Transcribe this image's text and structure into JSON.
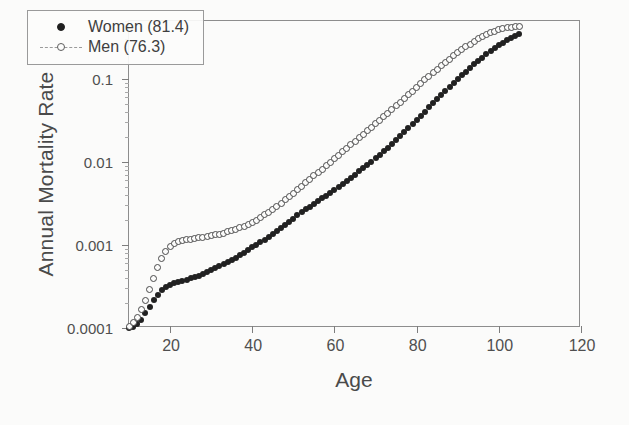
{
  "chart_data": {
    "type": "scatter",
    "title": "",
    "xlabel": "Age",
    "ylabel": "Annual Mortality Rate",
    "xlim": [
      10,
      120
    ],
    "ylim": [
      0.0001,
      0.5
    ],
    "yscale": "log",
    "grid": false,
    "legend_position": "upper-left-inside",
    "xticks": [
      20,
      40,
      60,
      80,
      100,
      120
    ],
    "xtick_labels": [
      "20",
      "40",
      "60",
      "80",
      "100",
      "120"
    ],
    "yticks": [
      0.0001,
      0.001,
      0.01,
      0.1
    ],
    "ytick_labels": [
      "0.0001",
      "0.001",
      "0.01",
      "0.1"
    ],
    "series": [
      {
        "name": "Women (81.4)",
        "marker": "filled-circle",
        "color": "#212121",
        "x": [
          10,
          11,
          12,
          13,
          14,
          15,
          16,
          17,
          18,
          19,
          20,
          21,
          22,
          23,
          24,
          25,
          26,
          27,
          28,
          29,
          30,
          31,
          32,
          33,
          34,
          35,
          36,
          37,
          38,
          39,
          40,
          41,
          42,
          43,
          44,
          45,
          46,
          47,
          48,
          49,
          50,
          51,
          52,
          53,
          54,
          55,
          56,
          57,
          58,
          59,
          60,
          61,
          62,
          63,
          64,
          65,
          66,
          67,
          68,
          69,
          70,
          71,
          72,
          73,
          74,
          75,
          76,
          77,
          78,
          79,
          80,
          81,
          82,
          83,
          84,
          85,
          86,
          87,
          88,
          89,
          90,
          91,
          92,
          93,
          94,
          95,
          96,
          97,
          98,
          99,
          100,
          101,
          102,
          103,
          104,
          105
        ],
        "y": [
          0.0001,
          0.000104,
          0.000112,
          0.000126,
          0.00015,
          0.00018,
          0.000215,
          0.00025,
          0.000285,
          0.00031,
          0.00033,
          0.000345,
          0.000358,
          0.00037,
          0.000382,
          0.000395,
          0.00041,
          0.000428,
          0.000448,
          0.00047,
          0.000495,
          0.000522,
          0.000552,
          0.000585,
          0.00062,
          0.00066,
          0.000705,
          0.000755,
          0.00081,
          0.00087,
          0.000935,
          0.001005,
          0.00108,
          0.00116,
          0.00125,
          0.00135,
          0.001465,
          0.001595,
          0.00174,
          0.0019,
          0.00208,
          0.00227,
          0.00247,
          0.00268,
          0.0029,
          0.00313,
          0.00338,
          0.00365,
          0.00394,
          0.00425,
          0.0046,
          0.00499,
          0.00543,
          0.00592,
          0.00646,
          0.00705,
          0.0077,
          0.00842,
          0.00922,
          0.0101,
          0.0111,
          0.0122,
          0.0134,
          0.0148,
          0.0164,
          0.0182,
          0.0203,
          0.0227,
          0.0254,
          0.0285,
          0.032,
          0.036,
          0.0405,
          0.0455,
          0.051,
          0.0575,
          0.0645,
          0.072,
          0.081,
          0.09,
          0.1,
          0.111,
          0.123,
          0.136,
          0.15,
          0.165,
          0.181,
          0.198,
          0.216,
          0.235,
          0.255,
          0.275,
          0.295,
          0.315,
          0.333,
          0.35
        ]
      },
      {
        "name": "Men (76.3)",
        "marker": "open-circle",
        "color": "#4a4a4a",
        "linestyle": "dashed",
        "x": [
          10,
          11,
          12,
          13,
          14,
          15,
          16,
          17,
          18,
          19,
          20,
          21,
          22,
          23,
          24,
          25,
          26,
          27,
          28,
          29,
          30,
          31,
          32,
          33,
          34,
          35,
          36,
          37,
          38,
          39,
          40,
          41,
          42,
          43,
          44,
          45,
          46,
          47,
          48,
          49,
          50,
          51,
          52,
          53,
          54,
          55,
          56,
          57,
          58,
          59,
          60,
          61,
          62,
          63,
          64,
          65,
          66,
          67,
          68,
          69,
          70,
          71,
          72,
          73,
          74,
          75,
          76,
          77,
          78,
          79,
          80,
          81,
          82,
          83,
          84,
          85,
          86,
          87,
          88,
          89,
          90,
          91,
          92,
          93,
          94,
          95,
          96,
          97,
          98,
          99,
          100,
          101,
          102,
          103,
          104,
          105
        ],
        "y": [
          0.000105,
          0.000115,
          0.000135,
          0.000165,
          0.000215,
          0.00029,
          0.00039,
          0.00053,
          0.00069,
          0.00084,
          0.00095,
          0.00103,
          0.00109,
          0.00113,
          0.00116,
          0.00118,
          0.0012,
          0.00122,
          0.00124,
          0.001265,
          0.00129,
          0.00132,
          0.001355,
          0.001395,
          0.00144,
          0.00149,
          0.001545,
          0.00161,
          0.001685,
          0.001775,
          0.00188,
          0.002,
          0.00214,
          0.0023,
          0.00248,
          0.00269,
          0.00293,
          0.0032,
          0.0035,
          0.00384,
          0.00422,
          0.00464,
          0.0051,
          0.00562,
          0.00618,
          0.0068,
          0.00748,
          0.00823,
          0.00905,
          0.00995,
          0.01095,
          0.01205,
          0.01325,
          0.0146,
          0.0161,
          0.0177,
          0.0195,
          0.0215,
          0.0237,
          0.0261,
          0.0288,
          0.0318,
          0.0352,
          0.0389,
          0.043,
          0.0476,
          0.0527,
          0.0584,
          0.0647,
          0.0717,
          0.0795,
          0.088,
          0.0975,
          0.108,
          0.119,
          0.131,
          0.145,
          0.159,
          0.174,
          0.191,
          0.208,
          0.226,
          0.245,
          0.264,
          0.284,
          0.304,
          0.323,
          0.342,
          0.36,
          0.376,
          0.39,
          0.402,
          0.412,
          0.42,
          0.426,
          0.43
        ]
      }
    ]
  },
  "legend": {
    "entries": [
      {
        "label": "Women (81.4)",
        "marker": "filled-circle"
      },
      {
        "label": "Men (76.3)",
        "marker": "open-circle-dashed"
      }
    ]
  },
  "axes": {
    "xlabel": "Age",
    "ylabel": "Annual Mortality Rate"
  }
}
